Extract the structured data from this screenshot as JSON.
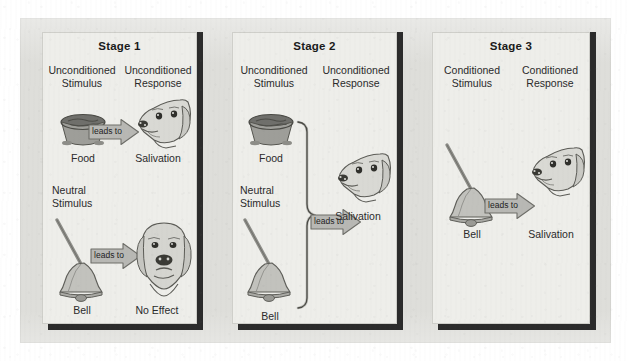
{
  "figure": {
    "panel_bg": "#eeeeea",
    "mat_bg": "#dededa",
    "edge_shadow": "#2b2b2b",
    "arrow_fill": "#b8b8b4",
    "bell_fill": "#bdbdb8",
    "bowl_fill": "#9a9a96",
    "dog_fill": "#d7d7d2",
    "text_color": "#2a2a2a"
  },
  "arrow_label": "leads to",
  "stages": [
    {
      "title": "Stage 1",
      "stimulus_label": "Unconditioned\nStimulus",
      "stimulus_label_line1": "Unconditioned",
      "stimulus_label_line2": "Stimulus",
      "response_label_line1": "Unconditioned",
      "response_label_line2": "Response",
      "rows": [
        {
          "stimulus_icon": "food-bowl-icon",
          "stimulus_caption": "Food",
          "arrow_label": "leads to",
          "response_icon": "dog-salivating-icon",
          "response_caption": "Salivation"
        },
        {
          "sub_label_line1": "Neutral",
          "sub_label_line2": "Stimulus",
          "stimulus_icon": "bell-icon",
          "stimulus_caption": "Bell",
          "arrow_label": "leads to",
          "response_icon": "dog-no-effect-icon",
          "response_caption": "No Effect"
        }
      ]
    },
    {
      "title": "Stage 2",
      "stimulus_label_line1": "Unconditioned",
      "stimulus_label_line2": "Stimulus",
      "response_label_line1": "Unconditioned",
      "response_label_line2": "Response",
      "bracket": true,
      "rows": [
        {
          "stimulus_icon": "food-bowl-icon",
          "stimulus_caption": "Food"
        },
        {
          "sub_label_line1": "Neutral",
          "sub_label_line2": "Stimulus",
          "stimulus_icon": "bell-icon",
          "stimulus_caption": "Bell"
        }
      ],
      "combined": {
        "arrow_label": "leads to",
        "response_icon": "dog-salivating-icon",
        "response_caption": "Salivation"
      }
    },
    {
      "title": "Stage 3",
      "stimulus_label_line1": "Conditioned",
      "stimulus_label_line2": "Stimulus",
      "response_label_line1": "Conditioned",
      "response_label_line2": "Response",
      "rows": [
        {
          "stimulus_icon": "bell-icon",
          "stimulus_caption": "Bell",
          "arrow_label": "leads to",
          "response_icon": "dog-salivating-icon",
          "response_caption": "Salivation"
        }
      ]
    }
  ]
}
